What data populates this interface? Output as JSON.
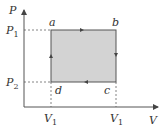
{
  "diagram": {
    "title": "",
    "axes": {
      "x_label": "V",
      "y_label": "P"
    },
    "ticks": {
      "p_upper": {
        "main": "P",
        "sub": "1"
      },
      "p_lower": {
        "main": "P",
        "sub": "2"
      },
      "v_left": {
        "main": "V",
        "sub": "1"
      },
      "v_right": {
        "main": "V",
        "sub": "1"
      }
    },
    "points": {
      "a": "a",
      "b": "b",
      "c": "c",
      "d": "d"
    },
    "cycle": {
      "path": [
        "a",
        "b",
        "c",
        "d",
        "a"
      ],
      "fill_color": "#d3d3d3",
      "stroke_color": "#555555"
    }
  }
}
